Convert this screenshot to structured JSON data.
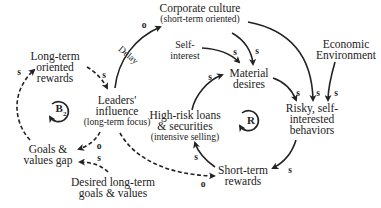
{
  "diagram": {
    "type": "causal-loop-diagram",
    "nodes": {
      "corporate_culture": {
        "title": "Corporate culture",
        "subtitle": "(short-term oriented)"
      },
      "economic_environment": {
        "line1": "Economic",
        "line2": "Environment"
      },
      "self_interest": {
        "line1": "Self-",
        "line2": "interest"
      },
      "material_desires": {
        "line1": "Material",
        "line2": "desires"
      },
      "long_term_rewards": {
        "line1": "Long-term",
        "line2": "oriented",
        "line3": "rewards"
      },
      "leaders_influence": {
        "line1": "Leaders'",
        "line2": "influence",
        "subtitle": "(long-term focus)"
      },
      "high_risk_loans": {
        "line1": "High-risk loans",
        "line2": "& securities",
        "subtitle": "(intensive selling)"
      },
      "risky_behaviors": {
        "line1": "Risky, self-",
        "line2": "interested",
        "line3": "behaviors"
      },
      "goals_gap": {
        "line1": "Goals &",
        "line2": "values gap"
      },
      "desired_goals": {
        "line1": "Desired long-term",
        "line2": "goals & values"
      },
      "short_term_rewards": {
        "line1": "Short-term",
        "line2": "rewards"
      }
    },
    "links": [
      {
        "from": "Leaders' influence",
        "to": "Corporate culture",
        "polarity": "o",
        "note": "Delay"
      },
      {
        "from": "Corporate culture",
        "to": "Material desires",
        "polarity": "s"
      },
      {
        "from": "Corporate culture",
        "to": "Risky, self-interested behaviors",
        "polarity": "s"
      },
      {
        "from": "Self-interest",
        "to": "Material desires",
        "polarity": "s"
      },
      {
        "from": "Economic Environment",
        "to": "Risky, self-interested behaviors",
        "polarity": "s"
      },
      {
        "from": "Material desires",
        "to": "Risky, self-interested behaviors",
        "polarity": "s"
      },
      {
        "from": "High-risk loans & securities",
        "to": "Material desires",
        "polarity": "s"
      },
      {
        "from": "Risky, self-interested behaviors",
        "to": "Short-term rewards",
        "polarity": "s"
      },
      {
        "from": "Short-term rewards",
        "to": "High-risk loans & securities",
        "polarity": "s"
      },
      {
        "from": "Long-term oriented rewards",
        "to": "Leaders' influence",
        "polarity": "s",
        "dashed": true
      },
      {
        "from": "Leaders' influence",
        "to": "Goals & values gap",
        "polarity": "o",
        "dashed": true
      },
      {
        "from": "Desired long-term goals & values",
        "to": "Goals & values gap",
        "polarity": "s",
        "dashed": true
      },
      {
        "from": "Goals & values gap",
        "to": "Long-term oriented rewards",
        "polarity": "s",
        "dashed": true
      },
      {
        "from": "Leaders' influence",
        "to": "Short-term rewards",
        "polarity": "o",
        "dashed": true
      }
    ],
    "polarity_labels": {
      "p1": "o",
      "p2": "s",
      "p3": "s",
      "p4": "s",
      "p5": "s",
      "p6": "s",
      "p7": "s",
      "p8": "s",
      "p9": "s",
      "p10": "s",
      "p11": "o",
      "p12": "s",
      "p13": "s",
      "p14": "o"
    },
    "delay_label": "Delay",
    "loops": {
      "balancing": {
        "letter": "B",
        "index": "2"
      },
      "reinforcing": {
        "letter": "R"
      }
    },
    "colors": {
      "ink": "#222222",
      "background": "#ffffff"
    }
  }
}
